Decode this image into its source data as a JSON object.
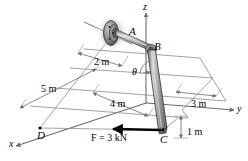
{
  "figure": {
    "type": "engineering-mechanics-free-body-diagram",
    "title": "",
    "background_color": "#ffffff",
    "width": 248,
    "height": 161
  },
  "axes": {
    "z": {
      "label": "z",
      "x": 143,
      "y": 2
    },
    "y": {
      "label": "y",
      "x": 237,
      "y": 104
    },
    "x": {
      "label": "x",
      "x": 9,
      "y": 139
    }
  },
  "points": [
    {
      "id": "A",
      "label": "A",
      "x": 129,
      "y": 26
    },
    {
      "id": "B",
      "label": "B",
      "x": 154,
      "y": 41
    },
    {
      "id": "C",
      "label": "C",
      "x": 160,
      "y": 134
    },
    {
      "id": "D",
      "label": "D",
      "x": 37,
      "y": 130
    }
  ],
  "angle": {
    "label": "θ",
    "x": 132,
    "y": 67
  },
  "dimensions": [
    {
      "id": "dim-2m",
      "label": "2 m",
      "x": 94,
      "y": 57
    },
    {
      "id": "dim-5m",
      "label": "5 m",
      "x": 41,
      "y": 84
    },
    {
      "id": "dim-4m",
      "label": "4 m",
      "x": 110,
      "y": 99
    },
    {
      "id": "dim-3m",
      "label": "3 m",
      "x": 191,
      "y": 99
    },
    {
      "id": "dim-1m",
      "label": "1 m",
      "x": 187,
      "y": 127
    }
  ],
  "force": {
    "id": "force-F",
    "label": "F = 3 kN",
    "magnitude": 3,
    "unit": "kN",
    "x": 91,
    "y": 133,
    "arrow_from": {
      "x": 160,
      "y": 130
    },
    "arrow_to": {
      "x": 111,
      "y": 130
    },
    "color": "#000000"
  },
  "colors": {
    "line": "#4a4a4a",
    "dim_line": "#6b6b6b",
    "member_fill": "#a8a8a8",
    "member_stroke": "#333333",
    "hub_dark": "#3c3c3c",
    "hub_mid": "#7a7a7a",
    "hub_light": "#c9c9c9",
    "force_arrow": "#000000",
    "text": "#000000"
  },
  "geometry": {
    "hub_center": {
      "x": 112,
      "y": 33
    },
    "hub_rx": 9,
    "hub_ry": 13,
    "shaft_axis_start": {
      "x": 85,
      "y": 23
    },
    "shaft_axis_end": {
      "x": 133,
      "y": 44
    },
    "arm_AB_start": {
      "x": 116,
      "y": 34
    },
    "arm_AB_end": {
      "x": 150,
      "y": 48
    },
    "boom_BC_start": {
      "x": 151,
      "y": 49
    },
    "boom_BC_end": {
      "x": 163,
      "y": 130
    }
  }
}
